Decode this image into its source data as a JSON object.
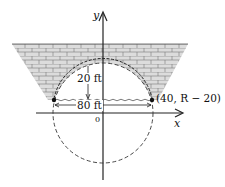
{
  "labels": {
    "y_axis": "y",
    "x_axis": "x",
    "origin": "0",
    "height": "20 ft",
    "width": "80 ft",
    "point": "(40, R − 20)"
  },
  "colors": {
    "stroke": "#222222",
    "brick_fill": "#d9d9d9",
    "brick_line": "#666666"
  }
}
